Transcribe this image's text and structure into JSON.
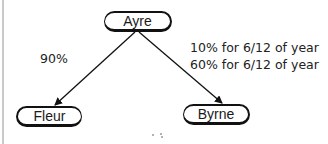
{
  "diagram": {
    "nodes": [
      {
        "id": "ayre",
        "label": "Ayre"
      },
      {
        "id": "fleur",
        "label": "Fleur"
      },
      {
        "id": "byrne",
        "label": "Byrne"
      }
    ],
    "edges": [
      {
        "from": "ayre",
        "to": "fleur",
        "label_lines": [
          "90%"
        ]
      },
      {
        "from": "ayre",
        "to": "byrne",
        "label_lines": [
          "10% for 6/12 of year",
          "60% for 6/12 of year"
        ]
      }
    ],
    "colors": {
      "stroke": "#111111",
      "text": "#222222",
      "border": "#c9c9c9",
      "background": "#ffffff"
    }
  }
}
